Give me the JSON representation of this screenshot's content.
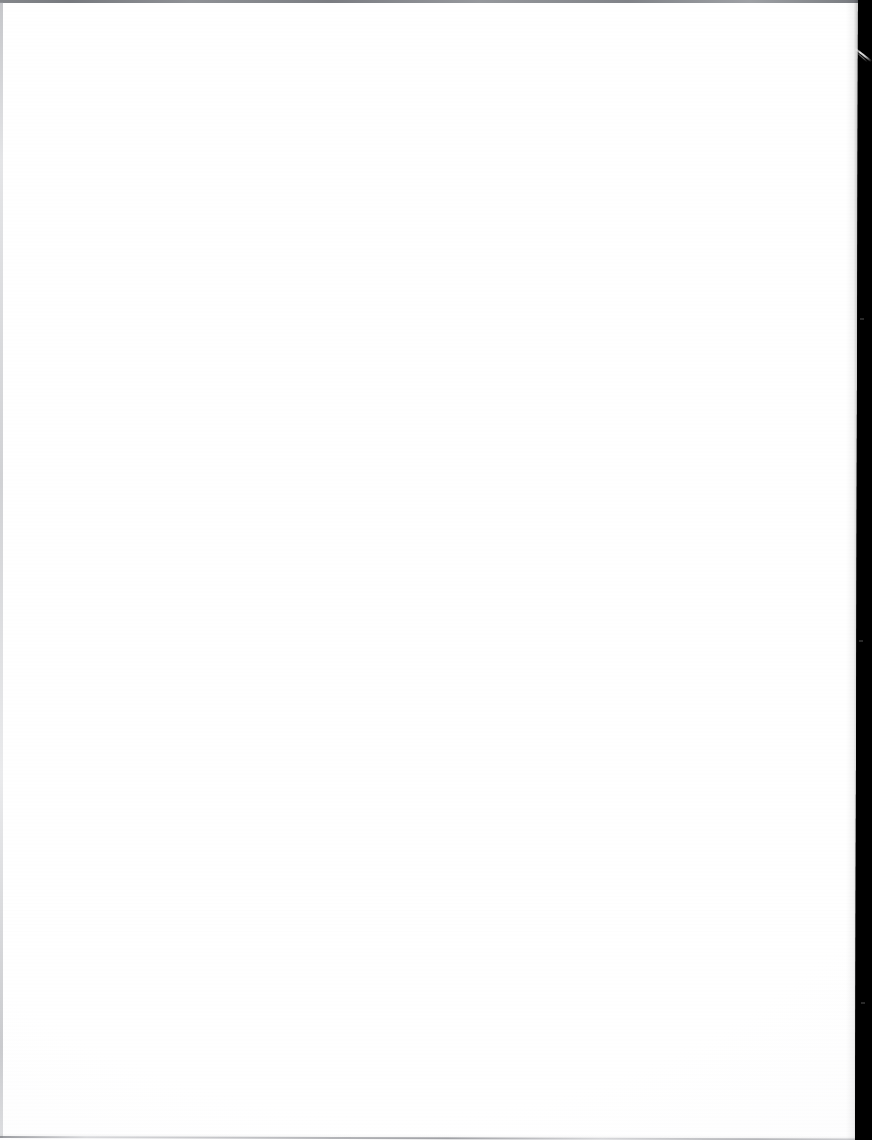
{
  "document": {
    "page_type": "blank-scanned-page",
    "media": "paper",
    "content_text": "",
    "visible_text_count": 0,
    "orientation": "portrait",
    "page_width_px": 872,
    "page_height_px": 1140
  },
  "scan": {
    "paper_color": "#fdfdfd",
    "paper_highlight_color": "#ffffff",
    "bed_color": "#000000",
    "top_edge_line_color": "#6f7277",
    "left_edge_line_color": "#9a9ca2",
    "bottom_edge_line_color": "#787a80",
    "streak_color": "#ffffff",
    "paper_right_edge_top_px": 858,
    "paper_right_edge_bottom_px": 855,
    "band_width_px": 17,
    "skew_degrees": 0.16
  },
  "artifacts": {
    "top_rule_label": "top scan edge rule",
    "left_margin_label": "left paper margin line",
    "bottom_rule_label": "bottom scan edge rule",
    "right_band_label": "scanner bed background",
    "streak_label": "diagonal light streak artifact",
    "streak_top_px": 48,
    "streak_height_px": 27
  },
  "content": {
    "body": ""
  }
}
